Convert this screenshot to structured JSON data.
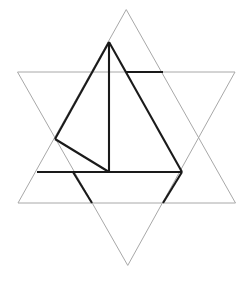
{
  "figure": {
    "width": 246,
    "height": 281,
    "background_color": "#ffffff",
    "light_stroke_color": "#a8a8a8",
    "bold_stroke_color": "#1a1a1a",
    "light_stroke_width": 1,
    "bold_stroke_width": 2.1
  },
  "chart_data": {
    "type": "diagram",
    "xlabel": "",
    "ylabel": "",
    "xlim": [
      0,
      246
    ],
    "ylim": [
      0,
      281
    ],
    "grid": false,
    "legend": "none",
    "shapes": [
      {
        "name": "upward-triangle",
        "style": "light",
        "closed": true,
        "points": [
          [
            126,
            10
          ],
          [
            18,
            203
          ],
          [
            235,
            203
          ]
        ]
      },
      {
        "name": "downward-triangle",
        "style": "light",
        "closed": true,
        "points": [
          [
            18,
            72
          ],
          [
            235,
            72
          ],
          [
            128,
            265
          ]
        ]
      }
    ],
    "bold_segments": [
      {
        "name": "vertical-altitude",
        "points": [
          [
            109,
            42
          ],
          [
            109,
            172
          ]
        ]
      },
      {
        "name": "apex-to-right-base",
        "points": [
          [
            109,
            42
          ],
          [
            182,
            172
          ]
        ]
      },
      {
        "name": "base-horizontal",
        "points": [
          [
            37,
            172
          ],
          [
            182,
            172
          ]
        ]
      },
      {
        "name": "apex-to-left-node",
        "points": [
          [
            109,
            42
          ],
          [
            55,
            139
          ]
        ]
      },
      {
        "name": "left-node-to-center-base",
        "points": [
          [
            55,
            139
          ],
          [
            109,
            172
          ]
        ]
      },
      {
        "name": "upper-right-horizontal",
        "points": [
          [
            126,
            72
          ],
          [
            163,
            72
          ]
        ]
      },
      {
        "name": "lower-left-spur",
        "points": [
          [
            73,
            172
          ],
          [
            92,
            203
          ]
        ]
      },
      {
        "name": "lower-right-spur",
        "points": [
          [
            182,
            172
          ],
          [
            163,
            203
          ]
        ]
      }
    ]
  }
}
